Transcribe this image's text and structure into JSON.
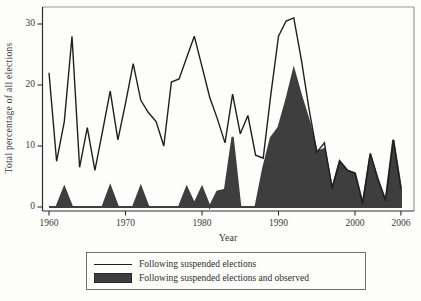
{
  "figure": {
    "y_axis_title": "Total percentage of all elections",
    "x_axis_title": "Year"
  },
  "legend": {
    "items": [
      {
        "label": "Following suspended elections",
        "swatch": "line"
      },
      {
        "label": "Following suspended elections and observed",
        "swatch": "filled-area"
      }
    ]
  },
  "colors": {
    "line": "#1f1f1f",
    "fill": "#3e3e3e",
    "axis": "#2e2e2e",
    "frame": "#9a9a9a",
    "text": "#3a3a3a",
    "background": "#fdfdfc"
  },
  "chart_data": {
    "type": "line",
    "title": "",
    "xlabel": "Year",
    "ylabel": "Total percentage of all elections",
    "xlim": [
      1960,
      2006
    ],
    "ylim": [
      0,
      32.8
    ],
    "x_ticks": [
      1960,
      1970,
      1980,
      1990,
      2000,
      2006
    ],
    "y_ticks": [
      0,
      10,
      20,
      30
    ],
    "grid": false,
    "legend_position": "bottom",
    "x": [
      1960,
      1961,
      1962,
      1963,
      1964,
      1965,
      1966,
      1967,
      1968,
      1969,
      1970,
      1971,
      1972,
      1973,
      1974,
      1975,
      1976,
      1977,
      1978,
      1979,
      1980,
      1981,
      1982,
      1983,
      1984,
      1985,
      1986,
      1987,
      1988,
      1989,
      1990,
      1991,
      1992,
      1993,
      1994,
      1995,
      1996,
      1997,
      1998,
      1999,
      2000,
      2001,
      2002,
      2003,
      2004,
      2005,
      2006
    ],
    "series": [
      {
        "name": "Following suspended elections",
        "style": "line",
        "values": [
          22,
          7.5,
          14,
          28,
          6.5,
          13,
          6,
          12.5,
          19,
          11,
          17,
          23.5,
          17.5,
          15.5,
          14,
          10,
          20.5,
          21,
          24.5,
          28,
          23,
          18,
          14.5,
          10.5,
          18.5,
          12,
          15,
          8.5,
          8,
          18.5,
          28,
          30.5,
          31,
          24,
          16,
          9,
          10.5,
          3,
          7.5,
          6,
          5.5,
          0.5,
          8.8,
          4.5,
          1,
          11,
          3
        ]
      },
      {
        "name": "Following suspended elections and observed",
        "style": "area",
        "values": [
          0,
          0,
          3.2,
          0,
          0,
          0,
          0,
          0,
          3.4,
          0,
          0,
          0,
          3.3,
          0,
          0,
          0,
          0,
          0,
          3.2,
          0.5,
          3.2,
          0,
          2.5,
          2.8,
          11.5,
          0,
          0,
          0,
          6.3,
          11.3,
          13,
          17.4,
          22.5,
          18,
          14,
          9,
          9.5,
          3,
          7.5,
          6,
          5.5,
          0.5,
          8.5,
          4.5,
          1,
          11,
          3
        ]
      }
    ]
  }
}
